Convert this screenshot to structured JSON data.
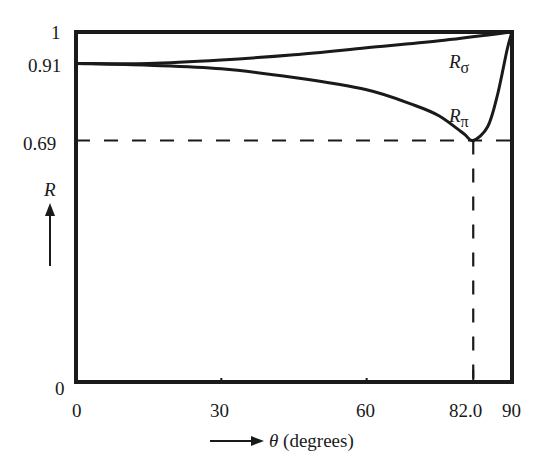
{
  "chart_data": {
    "type": "line",
    "title": "",
    "xlabel": "θ (degrees)",
    "ylabel": "R",
    "xlim": [
      0,
      90
    ],
    "ylim": [
      0,
      1
    ],
    "grid": false,
    "legend": "inline labels",
    "x_ticks": [
      "0",
      "30",
      "60",
      "82.0",
      "90"
    ],
    "x_tick_values": [
      0,
      30,
      60,
      82.0,
      90
    ],
    "y_ticks": [
      "0",
      "0.69",
      "0.91",
      "1"
    ],
    "y_tick_values": [
      0,
      0.69,
      0.91,
      1
    ],
    "series": [
      {
        "name": "Rσ",
        "label_main": "R",
        "label_sub": "σ",
        "x": [
          0,
          15,
          30,
          45,
          60,
          75,
          90
        ],
        "values": [
          0.91,
          0.91,
          0.92,
          0.935,
          0.955,
          0.975,
          1.0
        ]
      },
      {
        "name": "Rπ",
        "label_main": "R",
        "label_sub": "π",
        "x": [
          0,
          15,
          30,
          45,
          60,
          70,
          75,
          80,
          82,
          85,
          87,
          89,
          90
        ],
        "values": [
          0.91,
          0.905,
          0.895,
          0.87,
          0.835,
          0.79,
          0.76,
          0.71,
          0.69,
          0.73,
          0.82,
          0.95,
          1.0
        ]
      }
    ],
    "annotations": [
      {
        "type": "hline-dashed",
        "y": 0.69,
        "from_x": 0,
        "to_x": 90
      },
      {
        "type": "vline-dashed",
        "x": 82.0,
        "from_y": 0,
        "to_y": 0.69
      }
    ]
  },
  "labels": {
    "y_axis_symbol": "R",
    "x_axis_theta": "θ",
    "x_axis_unit": " (degrees)",
    "rsigma_main": "R",
    "rsigma_sub": "σ",
    "rpi_main": "R",
    "rpi_sub": "π",
    "ytick_1": "1",
    "ytick_091": "0.91",
    "ytick_069": "0.69",
    "ytick_0": "0",
    "xtick_0": "0",
    "xtick_30": "30",
    "xtick_60": "60",
    "xtick_82": "82.0",
    "xtick_90": "90"
  }
}
